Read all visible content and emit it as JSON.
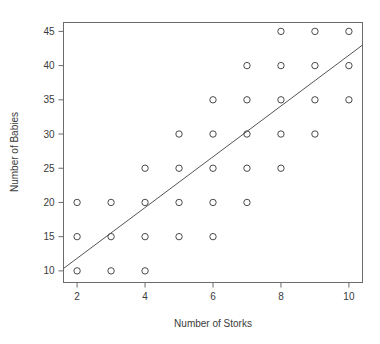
{
  "chart_data": {
    "type": "scatter",
    "title": "",
    "xlabel": "Number of Storks",
    "ylabel": "Number of Babies",
    "xlim": [
      1.6,
      10.4
    ],
    "ylim": [
      8.3,
      46.3
    ],
    "xticks": [
      2,
      4,
      6,
      8,
      10
    ],
    "xtick_labels": [
      "2",
      "4",
      "6",
      "8",
      "10"
    ],
    "yticks": [
      10,
      15,
      20,
      25,
      30,
      35,
      40,
      45
    ],
    "ytick_labels": [
      "10",
      "15",
      "20",
      "25",
      "30",
      "35",
      "40",
      "45"
    ],
    "grid": false,
    "legend": null,
    "marker": "open-circle",
    "marker_color": "#4a4a4a",
    "frame_color": "#6b6b6b",
    "points": [
      {
        "x": 2,
        "y": 10
      },
      {
        "x": 2,
        "y": 15
      },
      {
        "x": 2,
        "y": 20
      },
      {
        "x": 3,
        "y": 10
      },
      {
        "x": 3,
        "y": 15
      },
      {
        "x": 3,
        "y": 20
      },
      {
        "x": 4,
        "y": 10
      },
      {
        "x": 4,
        "y": 15
      },
      {
        "x": 4,
        "y": 20
      },
      {
        "x": 4,
        "y": 25
      },
      {
        "x": 5,
        "y": 15
      },
      {
        "x": 5,
        "y": 20
      },
      {
        "x": 5,
        "y": 25
      },
      {
        "x": 5,
        "y": 30
      },
      {
        "x": 6,
        "y": 15
      },
      {
        "x": 6,
        "y": 20
      },
      {
        "x": 6,
        "y": 25
      },
      {
        "x": 6,
        "y": 30
      },
      {
        "x": 6,
        "y": 35
      },
      {
        "x": 7,
        "y": 20
      },
      {
        "x": 7,
        "y": 25
      },
      {
        "x": 7,
        "y": 30
      },
      {
        "x": 7,
        "y": 35
      },
      {
        "x": 7,
        "y": 40
      },
      {
        "x": 8,
        "y": 25
      },
      {
        "x": 8,
        "y": 30
      },
      {
        "x": 8,
        "y": 35
      },
      {
        "x": 8,
        "y": 40
      },
      {
        "x": 8,
        "y": 45
      },
      {
        "x": 9,
        "y": 30
      },
      {
        "x": 9,
        "y": 35
      },
      {
        "x": 9,
        "y": 40
      },
      {
        "x": 9,
        "y": 45
      },
      {
        "x": 10,
        "y": 35
      },
      {
        "x": 10,
        "y": 40
      },
      {
        "x": 10,
        "y": 45
      }
    ],
    "trendline": {
      "label": "regression-line",
      "x_start": 1.6,
      "y_start": 10.35,
      "x_end": 10.4,
      "y_end": 43.0,
      "color": "#555555"
    }
  }
}
